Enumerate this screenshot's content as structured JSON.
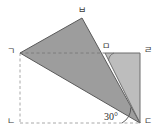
{
  "figure": {
    "background_color": "#ffffff",
    "stroke_color": "#5a5a5a",
    "dash_color": "#9a9a9a",
    "fill_dark": "#9d9d9d",
    "fill_light": "#bdbdbd",
    "labels": {
      "left_vertex": "ㄱ",
      "bottom_left_vertex": "ㄴ",
      "bottom_right_vertex": "ㄷ",
      "top_right_vertex": "ㄹ",
      "mid_top_vertex": "ㅁ",
      "apex_vertex": "ㅂ"
    },
    "angle": {
      "value": "30",
      "degree_symbol": "°",
      "text": "30°"
    },
    "points": {
      "g": {
        "x": 20,
        "y": 53
      },
      "n": {
        "x": 20,
        "y": 123
      },
      "d": {
        "x": 140,
        "y": 123
      },
      "r": {
        "x": 140,
        "y": 53
      },
      "m": {
        "x": 105,
        "y": 53
      },
      "b": {
        "x": 82,
        "y": 18
      }
    },
    "shapes": [
      {
        "name": "triangle-m-r-d",
        "vertices": "m,r,d",
        "fill": "#bdbdbd"
      },
      {
        "name": "triangle-g-b-d",
        "vertices": "g,b,d",
        "fill": "#9d9d9d"
      }
    ],
    "segments": [
      {
        "name": "segment-g-m",
        "style": "dashed"
      },
      {
        "name": "segment-g-n",
        "style": "dashed"
      },
      {
        "name": "segment-n-d",
        "style": "dashed"
      },
      {
        "name": "segment-m-r",
        "style": "solid"
      },
      {
        "name": "segment-r-d",
        "style": "solid"
      },
      {
        "name": "segment-g-b",
        "style": "solid"
      },
      {
        "name": "segment-b-d",
        "style": "solid"
      },
      {
        "name": "segment-g-d",
        "style": "solid"
      },
      {
        "name": "segment-m-d",
        "style": "solid"
      }
    ]
  }
}
